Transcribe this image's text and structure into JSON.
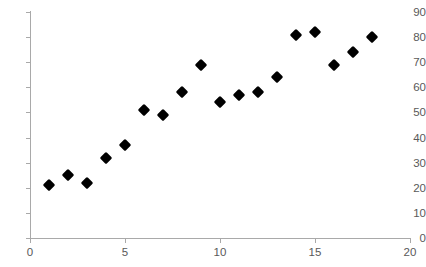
{
  "chart_data": {
    "type": "scatter",
    "title": "",
    "subtitle": "",
    "xlabel": "",
    "ylabel": "",
    "xlim": [
      0,
      20
    ],
    "ylim": [
      0,
      90
    ],
    "xticks": [
      0,
      5,
      10,
      15,
      20
    ],
    "yticks": [
      0,
      10,
      20,
      30,
      40,
      50,
      60,
      70,
      80,
      90
    ],
    "xtick_labels": [
      "0",
      "5",
      "10",
      "15",
      "20"
    ],
    "ytick_labels": [
      "0",
      "10",
      "20",
      "30",
      "40",
      "50",
      "60",
      "70",
      "80",
      "90"
    ],
    "grid": false,
    "legend": false,
    "legend_position": "none",
    "marker": "diamond",
    "marker_color": "#000000",
    "axis_color": "#a9a9a9",
    "tick_label_color": "#595959",
    "background_color": "#ffffff",
    "series": [
      {
        "name": "Series 1",
        "points": [
          {
            "x": 1,
            "y": 21
          },
          {
            "x": 2,
            "y": 25
          },
          {
            "x": 3,
            "y": 22
          },
          {
            "x": 4,
            "y": 32
          },
          {
            "x": 5,
            "y": 37
          },
          {
            "x": 6,
            "y": 51
          },
          {
            "x": 7,
            "y": 49
          },
          {
            "x": 8,
            "y": 58
          },
          {
            "x": 9,
            "y": 69
          },
          {
            "x": 10,
            "y": 54
          },
          {
            "x": 11,
            "y": 57
          },
          {
            "x": 12,
            "y": 58
          },
          {
            "x": 13,
            "y": 64
          },
          {
            "x": 14,
            "y": 81
          },
          {
            "x": 15,
            "y": 82
          },
          {
            "x": 16,
            "y": 69
          },
          {
            "x": 17,
            "y": 74
          },
          {
            "x": 18,
            "y": 80
          }
        ]
      }
    ]
  }
}
